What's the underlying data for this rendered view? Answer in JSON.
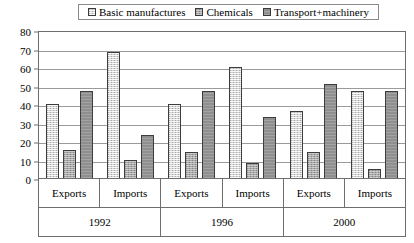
{
  "legend": {
    "items": [
      {
        "label": "Basic manufactures",
        "swatch": "legend-swatch-basic-manufactures",
        "color": "#d4d4d4"
      },
      {
        "label": "Chemicals",
        "swatch": "legend-swatch-chemicals",
        "color": "#a6a6a6"
      },
      {
        "label": "Transport+machinery",
        "swatch": "legend-swatch-transport-machinery",
        "color": "#8f8f8f"
      }
    ]
  },
  "axis": {
    "y_ticks": [
      "0",
      "10",
      "20",
      "30",
      "40",
      "50",
      "60",
      "70",
      "80"
    ],
    "periods": [
      "1992",
      "1996",
      "2000"
    ],
    "subgroups": [
      "Exports",
      "Imports",
      "Exports",
      "Imports",
      "Exports",
      "Imports"
    ]
  },
  "chart_data": {
    "type": "bar",
    "title": "",
    "xlabel": "",
    "ylabel": "",
    "ylim": [
      0,
      80
    ],
    "ytick_step": 10,
    "grid": true,
    "legend_position": "top",
    "categories": [
      "1992 Exports",
      "1992 Imports",
      "1996 Exports",
      "1996 Imports",
      "2000 Exports",
      "2000 Imports"
    ],
    "groups": [
      {
        "period": "1992",
        "subgroups": [
          "Exports",
          "Imports"
        ]
      },
      {
        "period": "1996",
        "subgroups": [
          "Exports",
          "Imports"
        ]
      },
      {
        "period": "2000",
        "subgroups": [
          "Exports",
          "Imports"
        ]
      }
    ],
    "series": [
      {
        "name": "Basic manufactures",
        "color": "#d4d4d4",
        "values": [
          40,
          68,
          40,
          60,
          36,
          47
        ]
      },
      {
        "name": "Chemicals",
        "color": "#a6a6a6",
        "values": [
          15,
          10,
          14,
          8,
          14,
          5
        ]
      },
      {
        "name": "Transport+machinery",
        "color": "#8f8f8f",
        "values": [
          47,
          23,
          47,
          33,
          51,
          47
        ]
      }
    ]
  }
}
